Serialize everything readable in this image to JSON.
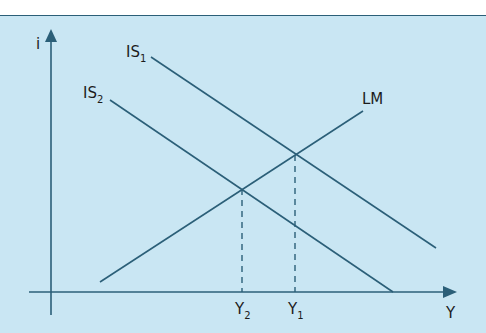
{
  "diagram": {
    "colors": {
      "background": "#c9e6f3",
      "line": "#2b5f78",
      "text": "#1c1c1c"
    },
    "axes": {
      "y_label": "i",
      "x_label": "Y"
    },
    "curves": [
      {
        "id": "IS1",
        "label": "IS",
        "subscript": "1",
        "x1": 151,
        "y1": 57,
        "x2": 436,
        "y2": 248
      },
      {
        "id": "IS2",
        "label": "IS",
        "subscript": "2",
        "x1": 110,
        "y1": 100,
        "x2": 393,
        "y2": 292
      },
      {
        "id": "LM",
        "label": "LM",
        "subscript": "",
        "x1": 100,
        "y1": 282,
        "x2": 363,
        "y2": 111
      }
    ],
    "equilibria": [
      {
        "id": "E2",
        "x": 242,
        "y": 189,
        "tick_label": "Y",
        "tick_subscript": "2"
      },
      {
        "id": "E1",
        "x": 295,
        "y": 155,
        "tick_label": "Y",
        "tick_subscript": "1"
      }
    ]
  }
}
